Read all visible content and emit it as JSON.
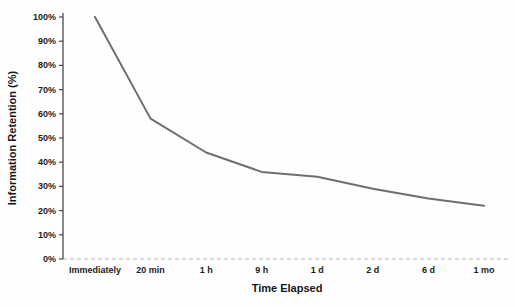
{
  "chart_data": {
    "type": "line",
    "title": "",
    "xlabel": "Time Elapsed",
    "ylabel": "Information Retention (%)",
    "categories": [
      "Immediately",
      "20 min",
      "1 h",
      "9 h",
      "1 d",
      "2 d",
      "6 d",
      "1 mo"
    ],
    "series": [
      {
        "name": "Information Retention",
        "values": [
          100,
          58,
          44,
          36,
          34,
          29,
          25,
          22
        ]
      }
    ],
    "ylim": [
      0,
      100
    ],
    "ytick_labels": [
      "0%",
      "10%",
      "20%",
      "30%",
      "40%",
      "50%",
      "60%",
      "70%",
      "80%",
      "90%",
      "100%"
    ],
    "grid": false,
    "legend_position": "none",
    "line_color": "#6e6e6e",
    "y_axis_color": "#4a4a4a",
    "x_axis_color": "#b5b5b5",
    "text_color": "#1c1c1c"
  }
}
